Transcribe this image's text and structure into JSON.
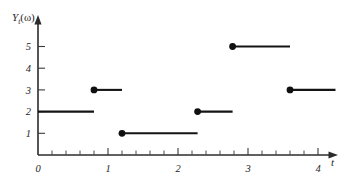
{
  "chart_data": {
    "type": "line",
    "subtype": "step-function-sample-path",
    "title": "",
    "xlabel": "t",
    "ylabel": "Y_t(ω)",
    "ylabel_parts": {
      "base": "Y",
      "subscript": "t",
      "argument": "(ω)"
    },
    "xlim": [
      0,
      4.35
    ],
    "ylim": [
      0,
      5.9
    ],
    "grid": false,
    "legend": null,
    "x_ticks": [
      0,
      1,
      2,
      3,
      4
    ],
    "x_tick_labels": [
      "0",
      "1",
      "2",
      "3",
      "4"
    ],
    "x_minor_tick_step": 0.2,
    "y_ticks": [
      1,
      2,
      3,
      4,
      5
    ],
    "y_tick_labels": [
      "1",
      "2",
      "3",
      "4",
      "5"
    ],
    "segments": [
      {
        "x_start": 0.0,
        "x_end": 0.8,
        "value": 2,
        "left_dot": false
      },
      {
        "x_start": 0.8,
        "x_end": 1.2,
        "value": 3,
        "left_dot": true
      },
      {
        "x_start": 1.2,
        "x_end": 2.28,
        "value": 1,
        "left_dot": true
      },
      {
        "x_start": 2.28,
        "x_end": 2.78,
        "value": 2,
        "left_dot": true
      },
      {
        "x_start": 2.78,
        "x_end": 3.6,
        "value": 5,
        "left_dot": true
      },
      {
        "x_start": 3.6,
        "x_end": 4.25,
        "value": 3,
        "left_dot": true
      }
    ],
    "jump_points": [
      {
        "t": 0.8,
        "value": 3
      },
      {
        "t": 1.2,
        "value": 1
      },
      {
        "t": 2.28,
        "value": 2
      },
      {
        "t": 2.78,
        "value": 5
      },
      {
        "t": 3.6,
        "value": 3
      }
    ],
    "colors": {
      "line": "#141414",
      "dot": "#101010",
      "axis": "#2b2b2b",
      "text": "#262626",
      "background": "#ffffff"
    }
  }
}
